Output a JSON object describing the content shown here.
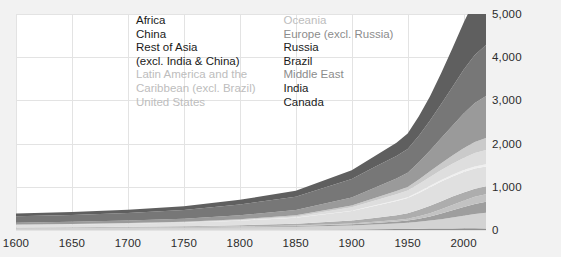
{
  "chart_data": {
    "type": "area",
    "title": "",
    "xlabel": "",
    "ylabel": "",
    "stacked": true,
    "grid": true,
    "legend_position": "inside-top",
    "xlim": [
      1600,
      2020
    ],
    "ylim": [
      0,
      5000
    ],
    "yticks": [
      0,
      1000,
      2000,
      3000,
      4000,
      5000
    ],
    "ytick_labels": [
      "0",
      "1,000",
      "2,000",
      "3,000",
      "4,000",
      "5,000"
    ],
    "xticks": [
      1600,
      1650,
      1700,
      1750,
      1800,
      1850,
      1900,
      1950,
      2000
    ],
    "xtick_labels": [
      "1600",
      "1650",
      "1700",
      "1750",
      "1800",
      "1850",
      "1900",
      "1950",
      "2000"
    ],
    "x": [
      1600,
      1650,
      1700,
      1750,
      1800,
      1850,
      1900,
      1920,
      1940,
      1950,
      1960,
      1970,
      1980,
      1990,
      2000,
      2010,
      2020
    ],
    "series": [
      {
        "name": "Canada",
        "color": "#8f8f8f",
        "values": [
          2,
          2,
          2,
          3,
          4,
          5,
          12,
          18,
          22,
          26,
          30,
          34,
          36,
          37,
          38,
          38,
          37
        ]
      },
      {
        "name": "India",
        "color": "#d3d3d3",
        "values": [
          40,
          42,
          45,
          50,
          58,
          70,
          95,
          110,
          130,
          140,
          160,
          185,
          215,
          250,
          290,
          330,
          360
        ]
      },
      {
        "name": "Middle East",
        "color": "#9e9e9e",
        "values": [
          5,
          6,
          7,
          9,
          12,
          16,
          24,
          32,
          42,
          52,
          70,
          95,
          130,
          170,
          205,
          235,
          255
        ]
      },
      {
        "name": "Brazil",
        "color": "#c2c2c2",
        "values": [
          3,
          4,
          5,
          7,
          10,
          14,
          22,
          30,
          38,
          45,
          58,
          75,
          98,
          122,
          145,
          165,
          178
        ]
      },
      {
        "name": "Russia",
        "color": "#adadad",
        "values": [
          10,
          12,
          15,
          20,
          28,
          40,
          65,
          85,
          110,
          125,
          150,
          172,
          188,
          195,
          192,
          188,
          185
        ]
      },
      {
        "name": "Europe (excl. Russia)",
        "color": "#e0e0e0",
        "values": [
          55,
          62,
          70,
          82,
          105,
          140,
          220,
          280,
          330,
          350,
          390,
          430,
          455,
          465,
          470,
          465,
          455
        ]
      },
      {
        "name": "Oceania",
        "color": "#efefef",
        "values": [
          1,
          1,
          2,
          2,
          3,
          5,
          10,
          14,
          18,
          21,
          26,
          32,
          38,
          42,
          46,
          50,
          52
        ]
      },
      {
        "name": "United States",
        "color": "#dedede",
        "values": [
          1,
          2,
          3,
          6,
          12,
          25,
          78,
          110,
          140,
          155,
          182,
          205,
          228,
          250,
          282,
          310,
          330
        ]
      },
      {
        "name": "Latin America and the Caribbean (excl. Brazil)",
        "color": "#cacaca",
        "values": [
          8,
          9,
          11,
          14,
          19,
          26,
          42,
          56,
          72,
          84,
          105,
          130,
          160,
          192,
          225,
          255,
          275
        ]
      },
      {
        "name": "Rest of Asia (excl. India & China)",
        "color": "#9a9a9a",
        "values": [
          45,
          50,
          58,
          70,
          90,
          120,
          185,
          235,
          290,
          330,
          400,
          485,
          580,
          690,
          805,
          905,
          975
        ]
      },
      {
        "name": "China",
        "color": "#777777",
        "values": [
          150,
          160,
          175,
          200,
          250,
          310,
          430,
          480,
          520,
          545,
          610,
          690,
          790,
          900,
          1010,
          1110,
          1180
        ]
      },
      {
        "name": "Africa",
        "color": "#5f5f5f",
        "values": [
          60,
          66,
          75,
          88,
          108,
          135,
          200,
          250,
          310,
          360,
          450,
          565,
          715,
          895,
          1090,
          1280,
          1420
        ]
      }
    ]
  },
  "legend": {
    "left_column": [
      {
        "label": "Africa",
        "tone": "dark"
      },
      {
        "label": "China",
        "tone": "dark"
      },
      {
        "label": "Rest of Asia",
        "tone": "dark"
      },
      {
        "label": "(excl. India & China)",
        "tone": "dark"
      },
      {
        "label": "Latin America and the",
        "tone": "light"
      },
      {
        "label": "Caribbean (excl. Brazil)",
        "tone": "light"
      },
      {
        "label": "United States",
        "tone": "light"
      }
    ],
    "right_column": [
      {
        "label": "Oceania",
        "tone": "light"
      },
      {
        "label": "Europe (excl. Russia)",
        "tone": "mid"
      },
      {
        "label": "Russia",
        "tone": "dark"
      },
      {
        "label": "Brazil",
        "tone": "dark"
      },
      {
        "label": "Middle East",
        "tone": "mid"
      },
      {
        "label": "India",
        "tone": "dark"
      },
      {
        "label": "Canada",
        "tone": "dark"
      }
    ]
  }
}
